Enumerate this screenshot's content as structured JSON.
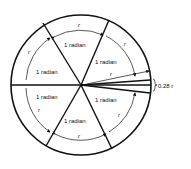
{
  "diagram": {
    "sector_label": "1 radian",
    "arc_label": "r",
    "remainder_label": "0.28 r",
    "sectors": [
      "1 radian",
      "1 radian",
      "1 radian",
      "1 radian",
      "1 radian",
      "1 radian"
    ]
  }
}
